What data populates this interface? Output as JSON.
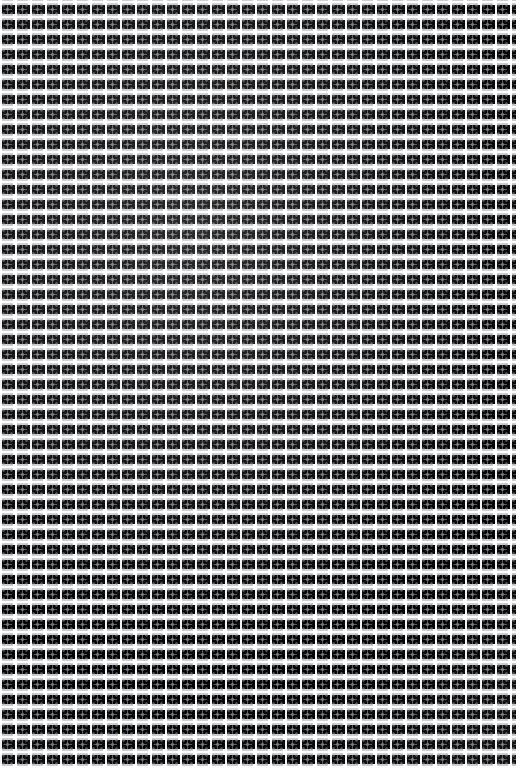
{
  "image": {
    "kind": "seamless-decorative-texture",
    "description": "Seamless repeating wallpaper-style texture: a dense grid of small square tiles, each framed by white gutters and containing a four-pointed star / diamond motif rendered in soft gray halftone grain.",
    "width_px": 516,
    "height_px": 768,
    "has_text": false,
    "has_ui_chrome": false,
    "orientation": "portrait"
  },
  "pattern": {
    "motif_name": "four-pointed-star-in-square",
    "tile_width_px": 15,
    "tile_height_px": 15,
    "tile_offset_y_px": 1,
    "columns_visible": 34,
    "rows_visible": 51,
    "gutter_width_px": 2,
    "symmetry": "4-fold (horizontal and vertical mirror)",
    "repeat_mode": "repeat",
    "edge_behavior": "tiles are clipped at all four image edges"
  },
  "palette": {
    "background": "#ffffff",
    "gutter": "#ffffff",
    "tile_body": "#b0b2b6",
    "motif_stroke": "#8c8f95",
    "motif_core": "#7a7d84",
    "frame_pip": "#969b9f",
    "grain": "#787b82",
    "overall_tone": "light-gray"
  },
  "layers": [
    {
      "name": "tile-body",
      "role": "textured gray square field of each tile"
    },
    {
      "name": "inner-field",
      "role": "lighter inner area carving the square frame ring"
    },
    {
      "name": "star-vertical-arm",
      "role": "vertical arm of the four-pointed star"
    },
    {
      "name": "star-horizontal-arm",
      "role": "horizontal arm of the four-pointed star"
    },
    {
      "name": "motif-core",
      "role": "darker diamond at the motif centre"
    },
    {
      "name": "frame-pips",
      "role": "corner dots of the square frame"
    },
    {
      "name": "grain-speckle",
      "role": "fine stochastic pixel noise"
    },
    {
      "name": "gutter-highlight",
      "role": "crisp white separating grid lines"
    },
    {
      "name": "vignette",
      "role": "subtle broad tonal drift across the surface"
    }
  ]
}
